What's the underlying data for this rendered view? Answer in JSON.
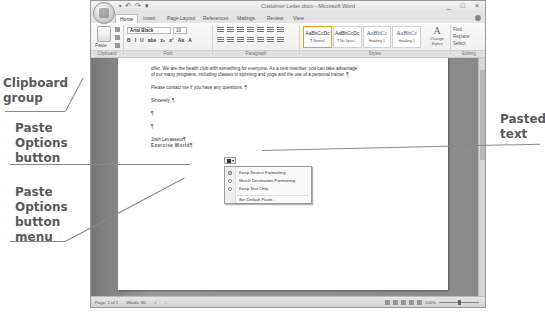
{
  "window": {
    "title": "Customer Letter.docx - Microsoft Word",
    "qat": [
      "save-icon",
      "undo-icon",
      "redo-icon",
      "customize-icon"
    ],
    "controls": [
      "_",
      "□",
      "×"
    ]
  },
  "tabs": [
    {
      "label": "Home",
      "active": true
    },
    {
      "label": "Insert"
    },
    {
      "label": "Page Layout"
    },
    {
      "label": "References"
    },
    {
      "label": "Mailings"
    },
    {
      "label": "Review"
    },
    {
      "label": "View"
    }
  ],
  "ribbon": {
    "clipboard": {
      "paste_label": "Paste",
      "group_label": "Clipboard"
    },
    "font": {
      "name": "Arial Black",
      "size": "10",
      "format_buttons": [
        "B",
        "I",
        "U",
        "abe",
        "x₂",
        "x²",
        "Aa",
        "A"
      ],
      "group_label": "Font"
    },
    "paragraph": {
      "group_label": "Paragraph"
    },
    "styles": {
      "group_label": "Styles",
      "gallery": [
        {
          "sample": "AaBbCcDc",
          "name": "¶ Normal",
          "selected": true
        },
        {
          "sample": "AaBbCcDc",
          "name": "¶ No Spaci..."
        },
        {
          "sample": "AaBbCc",
          "name": "Heading 1"
        },
        {
          "sample": "AaBbCc",
          "name": "Heading 2"
        }
      ],
      "change_styles": "Change Styles"
    },
    "editing": {
      "find": "Find",
      "replace": "Replace",
      "select": "Select",
      "group_label": "Editing"
    }
  },
  "document": {
    "lines": [
      "offer. We are the health club with something for everyone. As a new member, you can take advantage",
      "of our many programs, including classes in spinning and yoga and the use of a personal trainer. ¶",
      "Please contact me if you have any questions. ¶",
      "Sincerely, ¶",
      "¶",
      "¶",
      "Josh Levasseur¶",
      "Exercise World¶"
    ]
  },
  "paste_options_menu": {
    "items": [
      {
        "label": "Keep Source Formatting",
        "selected": true
      },
      {
        "label": "Match Destination Formatting"
      },
      {
        "label": "Keep Text Only"
      }
    ],
    "footer": "Set Default Paste..."
  },
  "statusbar": {
    "page": "Page: 1 of 1",
    "words": "Words: 80",
    "zoom": "100%"
  },
  "callouts": {
    "clipboard_group": "Clipboard group",
    "paste_options_button": "Paste Options button",
    "paste_options_menu": "Paste Options button menu",
    "pasted_text": "Pasted text"
  }
}
